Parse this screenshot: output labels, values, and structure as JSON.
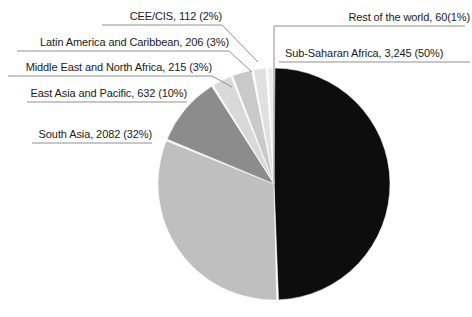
{
  "chart_data": {
    "type": "pie",
    "title": "",
    "subtitle": "",
    "xlabel": "",
    "ylabel": "",
    "legend_position": "none",
    "grid": false,
    "total": 6552,
    "units": "thousands",
    "start_angle_deg": 0,
    "direction": "clockwise",
    "categories": [
      "Sub-Saharan Africa",
      "South Asia",
      "East Asia and Pacific",
      "Middle East and North Africa",
      "Latin America and Caribbean",
      "CEE/CIS",
      "Rest of the world"
    ],
    "values": [
      3245,
      2082,
      632,
      215,
      206,
      112,
      60
    ],
    "percents": [
      50,
      32,
      10,
      3,
      3,
      2,
      1
    ],
    "colors": [
      "#0d0d0d",
      "#bfbfbf",
      "#8c8c8c",
      "#d9d9d9",
      "#c9c9c9",
      "#e0e0e0",
      "#ededed"
    ],
    "slices": [
      {
        "name": "Sub-Saharan Africa",
        "value": 3245,
        "value_text": "3,245",
        "percent": 50,
        "percent_text": "(50%)",
        "label": "Sub-Saharan Africa, 3,245 (50%)",
        "color": "#0d0d0d"
      },
      {
        "name": "South Asia",
        "value": 2082,
        "value_text": "2082",
        "percent": 32,
        "percent_text": "(32%)",
        "label": "South Asia, 2082 (32%)",
        "color": "#bfbfbf"
      },
      {
        "name": "East Asia and Pacific",
        "value": 632,
        "value_text": "632",
        "percent": 10,
        "percent_text": "(10%)",
        "label": "East Asia and Pacific, 632 (10%)",
        "color": "#8c8c8c"
      },
      {
        "name": "Middle East and North Africa",
        "value": 215,
        "value_text": "215",
        "percent": 3,
        "percent_text": "(3%)",
        "label": "Middle East and North Africa, 215 (3%)",
        "color": "#d9d9d9"
      },
      {
        "name": "Latin America and Caribbean",
        "value": 206,
        "value_text": "206",
        "percent": 3,
        "percent_text": "(3%)",
        "label": "Latin America and Caribbean, 206 (3%)",
        "color": "#c9c9c9"
      },
      {
        "name": "CEE/CIS",
        "value": 112,
        "value_text": "112",
        "percent": 2,
        "percent_text": "(2%)",
        "label": "CEE/CIS, 112 (2%)",
        "color": "#e0e0e0"
      },
      {
        "name": "Rest of the world",
        "value": 60,
        "value_text": "60",
        "percent": 1,
        "percent_text": "(1%)",
        "label": "Rest of the world, 60(1%)",
        "color": "#ededed"
      }
    ]
  },
  "labels": {
    "cee_cis": "CEE/CIS, 112 (2%)",
    "latin_america": "Latin America and Caribbean, 206 (3%)",
    "middle_east": "Middle East and North Africa, 215 (3%)",
    "east_asia": "East Asia and Pacific, 632 (10%)",
    "south_asia": "South Asia, 2082 (32%)",
    "rest_of_world": "Rest of the world, 60(1%)",
    "sub_saharan": "Sub-Saharan Africa, 3,245 (50%)"
  },
  "style": {
    "text_color": "#1a1a1a",
    "leader_color": "#8f8f8f",
    "background": "#ffffff",
    "slice_gap_color": "#ffffff"
  }
}
